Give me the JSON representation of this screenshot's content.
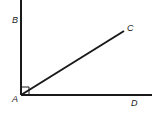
{
  "diagram": {
    "type": "geometry-angles",
    "points": {
      "A": {
        "label": "A",
        "x": 21,
        "y": 95
      },
      "B": {
        "label": "B",
        "x": 21,
        "y": 0
      },
      "C": {
        "label": "C",
        "x": 124,
        "y": 31
      },
      "D": {
        "label": "D",
        "x": 152,
        "y": 95
      }
    },
    "labels": {
      "A": "A",
      "B": "B",
      "C": "C",
      "D": "D"
    },
    "right_angle_at": "A",
    "line_color": "#1a1a1a"
  }
}
